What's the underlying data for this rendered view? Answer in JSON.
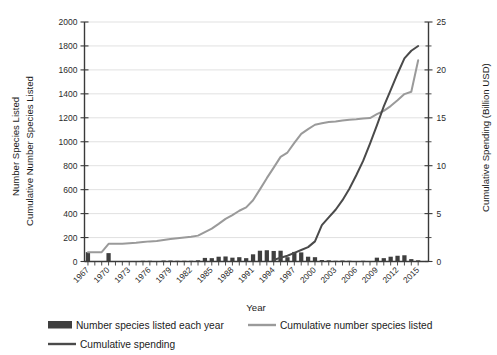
{
  "chart_data": {
    "type": "bar",
    "title": "",
    "xlabel": "Year",
    "ylabel_left_line1": "Number Species Listed",
    "ylabel_left_line2": "Cumulative Number Species Listed",
    "ylabel_right": "Cumulative Spending (Billion USD)",
    "grid": true,
    "legend_position": "bottom",
    "ylim_left": [
      0,
      2000
    ],
    "ylim_right": [
      0,
      25
    ],
    "yticks_left": [
      0,
      200,
      400,
      600,
      800,
      1000,
      1200,
      1400,
      1600,
      1800,
      2000
    ],
    "yticks_right": [
      0,
      5,
      10,
      15,
      20,
      25
    ],
    "yticks_right_minor": [
      2.5,
      7.5,
      12.5,
      17.5,
      22.5
    ],
    "xlim": [
      1966.5,
      2016.5
    ],
    "x": [
      1967,
      1968,
      1969,
      1970,
      1971,
      1972,
      1973,
      1974,
      1975,
      1976,
      1977,
      1978,
      1979,
      1980,
      1981,
      1982,
      1983,
      1984,
      1985,
      1986,
      1987,
      1988,
      1989,
      1990,
      1991,
      1992,
      1993,
      1994,
      1995,
      1996,
      1997,
      1998,
      1999,
      2000,
      2001,
      2002,
      2003,
      2004,
      2005,
      2006,
      2007,
      2008,
      2009,
      2010,
      2011,
      2012,
      2013,
      2014,
      2015
    ],
    "xtick_labels": [
      "1967",
      "1970",
      "1973",
      "1976",
      "1979",
      "1982",
      "1985",
      "1988",
      "1991",
      "1994",
      "1997",
      "2000",
      "2003",
      "2006",
      "2009",
      "2012",
      "2015"
    ],
    "series": [
      {
        "name": "Number species listed each year",
        "type": "bar",
        "axis": "left",
        "color": "#3f3f3f",
        "values": [
          78,
          0,
          0,
          70,
          0,
          0,
          4,
          4,
          6,
          6,
          4,
          8,
          8,
          6,
          6,
          6,
          10,
          30,
          28,
          40,
          42,
          32,
          36,
          28,
          60,
          90,
          94,
          88,
          90,
          36,
          80,
          76,
          40,
          36,
          12,
          10,
          6,
          8,
          6,
          4,
          6,
          4,
          32,
          28,
          40,
          48,
          52,
          20,
          10
        ]
      },
      {
        "name": "Cumulative number species listed",
        "type": "line",
        "axis": "left",
        "color": "#9a9a9a",
        "values": [
          78,
          78,
          78,
          148,
          148,
          148,
          152,
          156,
          162,
          168,
          172,
          180,
          188,
          194,
          200,
          206,
          216,
          246,
          274,
          314,
          356,
          388,
          424,
          452,
          512,
          602,
          696,
          784,
          874,
          910,
          990,
          1066,
          1106,
          1142,
          1154,
          1164,
          1170,
          1178,
          1184,
          1188,
          1194,
          1198,
          1230,
          1258,
          1298,
          1346,
          1398,
          1418,
          1680
        ]
      },
      {
        "name": "Cumulative spending",
        "type": "line",
        "axis": "right",
        "color": "#4a4a4a",
        "values": [
          null,
          null,
          null,
          null,
          null,
          null,
          null,
          null,
          null,
          null,
          null,
          null,
          null,
          null,
          null,
          null,
          null,
          null,
          null,
          null,
          null,
          null,
          null,
          null,
          null,
          null,
          null,
          0.15,
          0.4,
          0.6,
          0.9,
          1.2,
          1.5,
          2.1,
          3.8,
          4.6,
          5.4,
          6.4,
          7.6,
          9.0,
          10.5,
          12.3,
          14.2,
          16.2,
          17.9,
          19.6,
          21.2,
          22.0,
          22.5
        ]
      }
    ]
  },
  "legend": {
    "items": [
      {
        "label": "Number species listed each year",
        "marker": "bar-swatch",
        "color": "#3f3f3f"
      },
      {
        "label": "Cumulative number species listed",
        "marker": "line-swatch",
        "color": "#9a9a9a"
      },
      {
        "label": "Cumulative spending",
        "marker": "line-swatch",
        "color": "#4a4a4a"
      }
    ]
  }
}
